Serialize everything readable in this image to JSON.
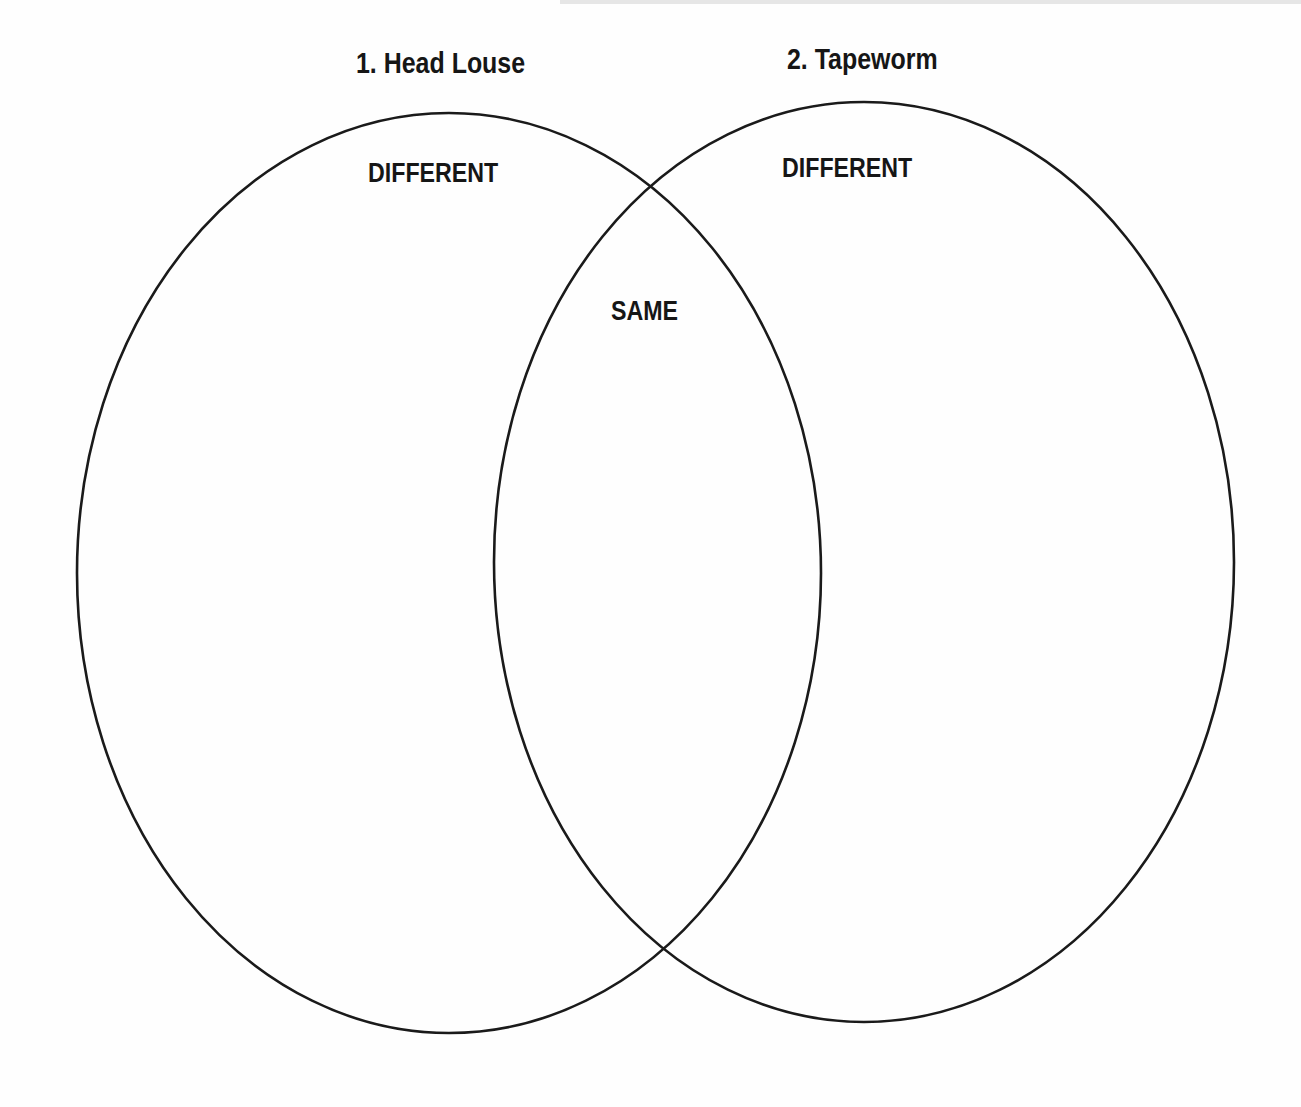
{
  "diagram": {
    "type": "venn",
    "sets": [
      {
        "id": "set1",
        "title": "1. Head Louse",
        "region_label": "DIFFERENT"
      },
      {
        "id": "set2",
        "title": "2. Tapeworm",
        "region_label": "DIFFERENT"
      }
    ],
    "intersection_label": "SAME",
    "colors": {
      "stroke": "#1a1a1a",
      "text": "#161616",
      "background": "#fefefe"
    }
  }
}
